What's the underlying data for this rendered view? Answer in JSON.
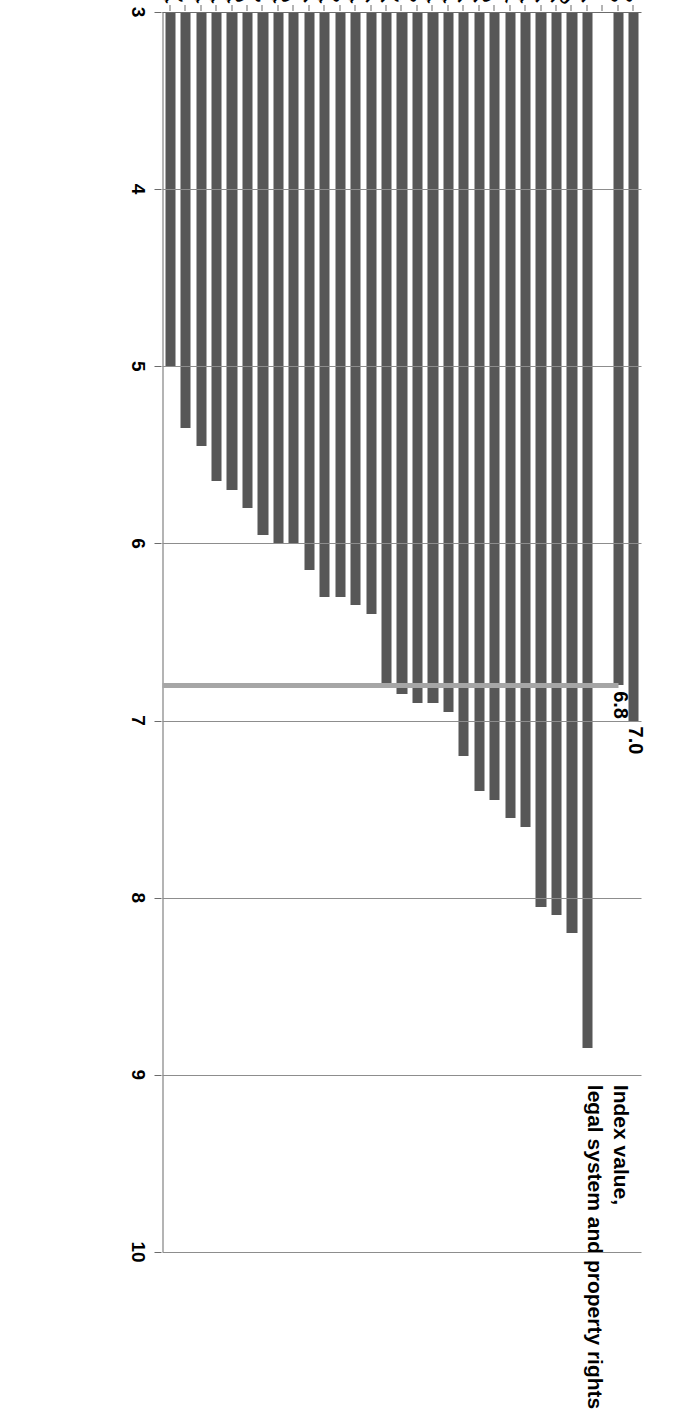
{
  "chart_data": {
    "type": "bar",
    "orientation": "vertical",
    "title": "Index value,\nlegal system and property rights",
    "xlabel": "",
    "ylabel": "Index value, legal system and property rights",
    "ylim": [
      3,
      10
    ],
    "yticks": [
      "3",
      "4",
      "5",
      "6",
      "7",
      "8",
      "9",
      "10"
    ],
    "grid": true,
    "legend": "none",
    "bar_color": "#575757",
    "reference_line": {
      "label": "EU-28 level",
      "value": 6.8,
      "color": "#a6a6a6"
    },
    "data_labels": [
      {
        "category": "United States",
        "text": "7.0"
      },
      {
        "category": "EU-28",
        "text": "6.8"
      }
    ],
    "categories": [
      "United States",
      "EU-28",
      "",
      "Finland",
      "Luxembourg",
      "Sweden",
      "Poland",
      "Austria",
      "Denmark",
      "Germany",
      "Ireland",
      "United Kingdom",
      "Estonia",
      "Malta",
      "Netherlands",
      "France",
      "Belgium",
      "Spain",
      "Latvia",
      "Cyprus",
      "Lithuania",
      "Portugal",
      "Hungary",
      "Slovenia",
      "Czech Republic",
      "Italy",
      "Croatia",
      "Slovakia",
      "Romania",
      "Greece",
      "Bulgaria"
    ],
    "values": [
      7.0,
      6.8,
      null,
      8.85,
      8.2,
      8.1,
      8.05,
      7.6,
      7.55,
      7.45,
      7.4,
      7.2,
      6.95,
      6.9,
      6.9,
      6.85,
      6.8,
      6.4,
      6.35,
      6.3,
      6.3,
      6.15,
      6.0,
      6.0,
      5.95,
      5.8,
      5.7,
      5.65,
      5.45,
      5.35,
      5.0
    ]
  }
}
